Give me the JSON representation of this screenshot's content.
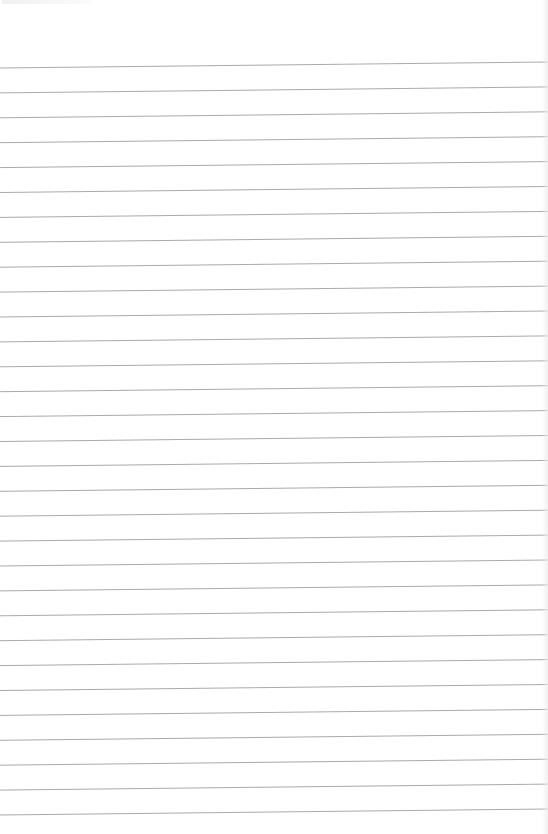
{
  "document": {
    "type": "lined-paper",
    "width": 548,
    "height": 834,
    "background_color": "#ffffff",
    "rule_color": "#aaaaaa",
    "rule_thickness": 1,
    "rule_count": 31,
    "first_rule_y_left": 68,
    "rule_spacing": 24.9,
    "right_edge_offset_y": -6,
    "content_text": ""
  }
}
